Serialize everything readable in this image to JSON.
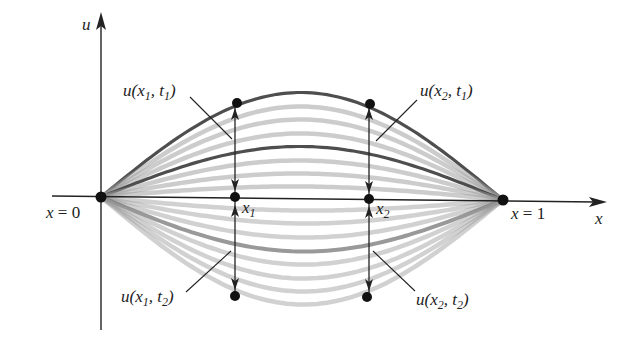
{
  "diagram": {
    "axes": {
      "vertical_label": "u",
      "horizontal_label": "x",
      "left_end_label": "x = 0",
      "right_end_label": "x = 1"
    },
    "points": {
      "x1_label": "x",
      "x1_sub": "1",
      "x2_label": "x",
      "x2_sub": "2"
    },
    "annotations": [
      {
        "id": "u_x1_t1",
        "text": "u(x1, t1)",
        "u": "u(x",
        "xs": "1",
        "mid": ", t",
        "ts": "1",
        "close": ")"
      },
      {
        "id": "u_x2_t1",
        "text": "u(x2, t1)",
        "u": "u(x",
        "xs": "2",
        "mid": ", t",
        "ts": "1",
        "close": ")"
      },
      {
        "id": "u_x1_t2",
        "text": "u(x1, t2)",
        "u": "u(x",
        "xs": "1",
        "mid": ", t",
        "ts": "2",
        "close": ")"
      },
      {
        "id": "u_x2_t2",
        "text": "u(x2, t2)",
        "u": "u(x",
        "xs": "2",
        "mid": ", t",
        "ts": "2",
        "close": ")"
      }
    ],
    "curves": {
      "count_upper": 8,
      "count_lower": 8,
      "highlighted_upper": [
        0,
        4
      ],
      "highlighted_lower": [
        3
      ],
      "curve_color": "#9a9a9a",
      "highlight_color": "#444444",
      "axis_color": "#222222"
    }
  }
}
